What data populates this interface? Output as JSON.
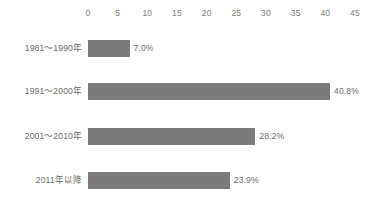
{
  "chart_data": {
    "type": "bar",
    "orientation": "horizontal",
    "title": "",
    "subtitle": "",
    "xlabel": "",
    "ylabel": "",
    "xlim": [
      0,
      45
    ],
    "grid": false,
    "legend": null,
    "categories": [
      "1981〜1990年",
      "1991〜2000年",
      "2001〜2010年",
      "2011年以降"
    ],
    "values": [
      7.0,
      40.8,
      28.2,
      23.9
    ],
    "value_labels": [
      "7.0%",
      "40.8%",
      "28.2%",
      "23.9%"
    ],
    "x_ticks": [
      0,
      5,
      10,
      15,
      20,
      25,
      30,
      35,
      40,
      45
    ],
    "x_tick_labels": [
      "0",
      "5",
      "10",
      "15",
      "20",
      "25",
      "30",
      "35",
      "40",
      "45"
    ],
    "colors": {
      "bar": "#7b7b7b",
      "text": "#6b6b6b",
      "tick_text": "#7d7d7d",
      "background": "#ffffff"
    }
  }
}
